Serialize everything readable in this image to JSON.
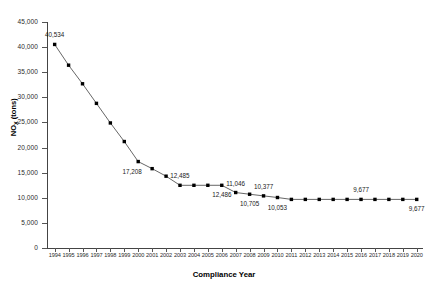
{
  "chart_data": {
    "type": "line",
    "title": "",
    "xlabel": "Compliance Year",
    "ylabel": "NOx (tons)",
    "ylabel_base": "NO",
    "ylabel_sub": "X",
    "ylabel_unit": " (tons)",
    "grid": false,
    "legend": "none",
    "ylim": [
      0,
      45000
    ],
    "ytick_labels": [
      "0",
      "5,000",
      "10,000",
      "15,000",
      "20,000",
      "25,000",
      "30,000",
      "35,000",
      "40,000",
      "45,000"
    ],
    "ytick_values": [
      0,
      5000,
      10000,
      15000,
      20000,
      25000,
      30000,
      35000,
      40000,
      45000
    ],
    "categories": [
      "1994",
      "1995",
      "1996",
      "1997",
      "1998",
      "1999",
      "2000",
      "2001",
      "2002",
      "2003",
      "2004",
      "2005",
      "2006",
      "2007",
      "2008",
      "2009",
      "2010",
      "2011",
      "2012",
      "2013",
      "2014",
      "2015",
      "2016",
      "2017",
      "2018",
      "2019",
      "2020"
    ],
    "values": [
      40534,
      36400,
      32700,
      28800,
      24900,
      21200,
      17208,
      15800,
      14300,
      12485,
      12485,
      12486,
      12486,
      11046,
      10705,
      10377,
      10053,
      9677,
      9677,
      9677,
      9677,
      9677,
      9677,
      9677,
      9677,
      9677,
      9677
    ],
    "series": [
      {
        "name": "NOx emissions",
        "values": [
          40534,
          36400,
          32700,
          28800,
          24900,
          21200,
          17208,
          15800,
          14300,
          12485,
          12485,
          12486,
          12486,
          11046,
          10705,
          10377,
          10053,
          9677,
          9677,
          9677,
          9677,
          9677,
          9677,
          9677,
          9677,
          9677,
          9677
        ]
      }
    ],
    "annotations": [
      {
        "category": "1994",
        "value": 40534,
        "text": "40,534",
        "position": "above"
      },
      {
        "category": "2000",
        "value": 17208,
        "text": "17,208",
        "position": "below-left"
      },
      {
        "category": "2003",
        "value": 12485,
        "text": "12,485",
        "position": "above"
      },
      {
        "category": "2006",
        "value": 12486,
        "text": "12,486",
        "position": "below"
      },
      {
        "category": "2007",
        "value": 11046,
        "text": "11,046",
        "position": "above"
      },
      {
        "category": "2008",
        "value": 10705,
        "text": "10,705",
        "position": "below"
      },
      {
        "category": "2009",
        "value": 10377,
        "text": "10,377",
        "position": "above"
      },
      {
        "category": "2010",
        "value": 10053,
        "text": "10,053",
        "position": "below"
      },
      {
        "category": "2016",
        "value": 9677,
        "text": "9,677",
        "position": "above"
      },
      {
        "category": "2020",
        "value": 9677,
        "text": "9,677",
        "position": "below"
      }
    ],
    "marker": "square",
    "marker_color": "#000000",
    "line_color": "#555555"
  }
}
